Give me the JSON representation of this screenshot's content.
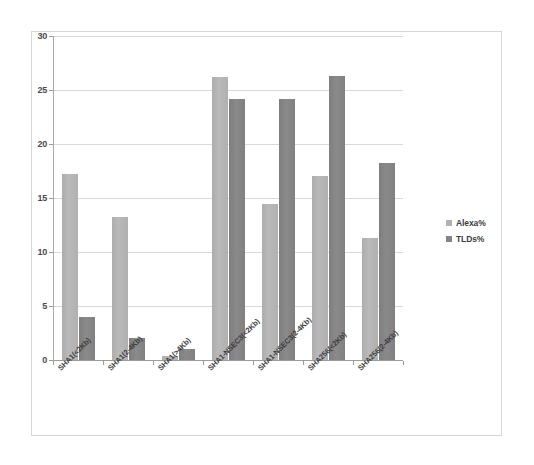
{
  "chart_data": {
    "type": "bar",
    "title": "",
    "subtitle": "",
    "xlabel": "",
    "ylabel": "",
    "ylim": [
      0,
      30
    ],
    "xlim_categories": 7,
    "grid": true,
    "legend_position": "right",
    "categories": [
      "SHA1(<2Kb)",
      "SHA1(2-4Kb)",
      "SHA1(>4Kb)",
      "SHA1-NSEC3(<2Kb)",
      "SHA1-NSEC3(2-4Kb)",
      "SHA256(<2Kb)",
      "SHA256(2-4Kb)"
    ],
    "series": [
      {
        "name": "Alexa%",
        "color": "#b2b2b2",
        "values": [
          17.2,
          13.2,
          0.4,
          26.2,
          14.4,
          17.0,
          11.3
        ]
      },
      {
        "name": "TLDs%",
        "color": "#848484",
        "values": [
          4.0,
          2.0,
          1.0,
          24.2,
          24.2,
          26.3,
          18.2
        ]
      }
    ],
    "y_ticks": [
      0,
      5,
      10,
      15,
      20,
      25,
      30
    ],
    "y_tick_labels": [
      "0",
      "5",
      "10",
      "15",
      "20",
      "25",
      "30"
    ]
  },
  "legend": {
    "items": [
      {
        "label": "Alexa%",
        "color": "#b2b2b2"
      },
      {
        "label": "TLDs%",
        "color": "#848484"
      }
    ]
  },
  "colors": {
    "alexa": "#b2b2b2",
    "tlds": "#848484",
    "gridline": "#d9d9d9",
    "axis": "#9c9c9c",
    "frame_border": "#d6d6d6",
    "background": "#ffffff",
    "text": "#3d3d3d"
  }
}
